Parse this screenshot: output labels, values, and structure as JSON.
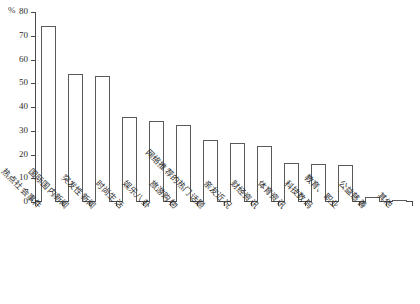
{
  "chart_data": {
    "type": "bar",
    "title": "",
    "subtitle": "",
    "xlabel": "",
    "ylabel": "%",
    "ylim": [
      0,
      80
    ],
    "yticks": [
      0,
      10,
      20,
      30,
      40,
      50,
      60,
      70,
      80
    ],
    "ytick_labels": [
      "0",
      "10",
      "20",
      "30",
      "40",
      "50",
      "60",
      "70",
      "80"
    ],
    "grid": false,
    "legend": null,
    "bar_color": "#ffffff",
    "bar_edge_color": "#5a5a5a",
    "axis_color": "#4a4a4a",
    "categories": [
      "热点社会事件",
      "国际国内新闻",
      "突发性新闻",
      "时尚生活",
      "娱乐八卦",
      "旅游购物",
      "网络推荐的热门话题",
      "亲友近况",
      "财经资讯",
      "体育资讯",
      "科技数码",
      "教育、职业",
      "公益慈善",
      "其他"
    ],
    "values": [
      74,
      54,
      53,
      36,
      34,
      32.5,
      26,
      25,
      23.5,
      16.5,
      16,
      15.5,
      2,
      1
    ]
  }
}
